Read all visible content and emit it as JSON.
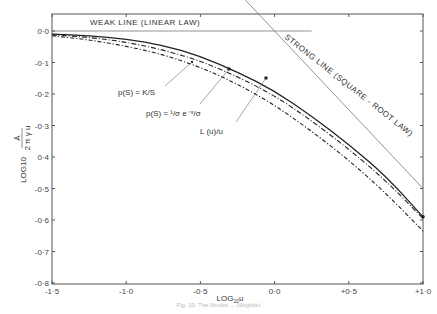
{
  "chart_data": {
    "type": "line",
    "title": "",
    "xlabel": "LOG10 u",
    "ylabel": "LOG10 (A / 2πγu)",
    "xlim": [
      -1.5,
      1.0
    ],
    "ylim": [
      -0.8,
      0.05
    ],
    "x_ticks": [
      -1.5,
      -1.0,
      -0.5,
      0.0,
      0.5,
      1.0
    ],
    "x_tick_labels": [
      "-1·5",
      "-1·0",
      "-0·5",
      "0·0",
      "+0·5",
      "+1·0"
    ],
    "y_ticks": [
      0.0,
      -0.1,
      -0.2,
      -0.3,
      -0.4,
      -0.5,
      -0.6,
      -0.7,
      -0.8
    ],
    "y_tick_labels": [
      "0·0",
      "-0·1",
      "-0·2",
      "-0·3",
      "0·4",
      "-0·5",
      "-0·6",
      "-0·7",
      "-0·8"
    ],
    "grid": false,
    "series": [
      {
        "name": "L(u)/u",
        "style": "solid",
        "x": [
          -1.5,
          -1.25,
          -1.0,
          -0.75,
          -0.5,
          -0.25,
          0.0,
          0.25,
          0.5,
          0.75,
          1.0
        ],
        "y": [
          -0.01,
          -0.015,
          -0.025,
          -0.045,
          -0.08,
          -0.13,
          -0.19,
          -0.27,
          -0.36,
          -0.46,
          -0.59
        ]
      },
      {
        "name": "p(S) = (1/σ) e^(-S/σ)",
        "style": "dashed",
        "x": [
          -1.5,
          -1.25,
          -1.0,
          -0.75,
          -0.5,
          -0.25,
          0.0,
          0.25,
          0.5,
          0.75,
          1.0
        ],
        "y": [
          -0.012,
          -0.02,
          -0.035,
          -0.06,
          -0.095,
          -0.145,
          -0.205,
          -0.285,
          -0.375,
          -0.475,
          -0.595
        ]
      },
      {
        "name": "p(S) = K/S",
        "style": "dash-dot",
        "x": [
          -1.5,
          -1.25,
          -1.0,
          -0.75,
          -0.5,
          -0.25,
          0.0,
          0.25,
          0.5,
          0.75,
          1.0
        ],
        "y": [
          -0.015,
          -0.028,
          -0.048,
          -0.075,
          -0.115,
          -0.168,
          -0.235,
          -0.318,
          -0.41,
          -0.515,
          -0.635
        ]
      },
      {
        "name": "WEAK LINE (LINEAR LAW)",
        "style": "thin-solid",
        "x": [
          -1.5,
          0.25
        ],
        "y": [
          0.0,
          0.0
        ]
      },
      {
        "name": "STRONG LINE (SQUARE - ROOT LAW)",
        "style": "thin-solid",
        "x": [
          -0.25,
          1.0
        ],
        "y": [
          0.125,
          -0.5
        ]
      }
    ],
    "annotations": [
      {
        "text": "WEAK   LINE  (LINEAR  LAW)",
        "target": "weak-line"
      },
      {
        "text": "STRONG  LINE  (SQUARE - ROOT  LAW)",
        "target": "strong-line"
      },
      {
        "text": "p(S) = K/S",
        "points_to": [
          -0.4,
          -0.11
        ]
      },
      {
        "text": "p(S) = 1/σ e^-S/σ",
        "points_to": [
          -0.3,
          -0.12
        ]
      },
      {
        "text": "L (u)/u",
        "points_to": [
          -0.05,
          -0.15
        ]
      }
    ]
  },
  "labels": {
    "xlabel_main": "LOG",
    "xlabel_sub": "10",
    "xlabel_var": "u",
    "ylabel_log": "LOG",
    "ylabel_sub": "10",
    "ylabel_num": "Ā",
    "ylabel_den": "2 π γ u",
    "weak_line": "WEAK   LINE  (LINEAR  LAW)",
    "strong_line": "STRONG  LINE  (SQUARE - ROOT  LAW)",
    "ann_ks": "p(S) = K/S",
    "ann_exp": "p(S) = ¹/σ e⁻ˢ/σ",
    "ann_lu": "L (u)/u",
    "caption": "Fig. 10. The Modes ... (illegible)"
  }
}
